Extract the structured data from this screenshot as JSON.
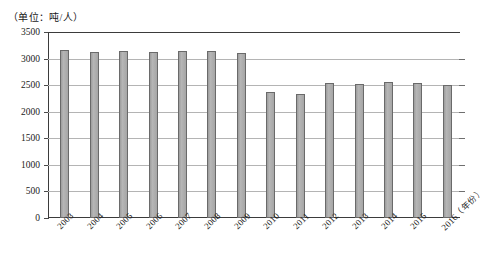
{
  "chart_data": {
    "type": "bar",
    "title": "",
    "subtitle": "",
    "unit_label": "（单位：吨/人）",
    "xlabel": "（年份）",
    "ylabel": "",
    "ylim": [
      0,
      3500
    ],
    "ytick_step": 500,
    "grid": true,
    "legend": "none",
    "bar_color": "#a8a8a8",
    "bar_border_color": "#6a6a6a",
    "grid_color": "#b4b4b4",
    "axis_color": "#3b3b3b",
    "categories": [
      "2003",
      "2004",
      "2005",
      "2006",
      "2007",
      "2008",
      "2009",
      "2010",
      "2011",
      "2012",
      "2013",
      "2014",
      "2015",
      "2016"
    ],
    "values": [
      3160,
      3120,
      3150,
      3130,
      3140,
      3140,
      3100,
      2380,
      2340,
      2540,
      2530,
      2560,
      2540,
      2510
    ],
    "yticks": [
      "0",
      "500",
      "1000",
      "1500",
      "2000",
      "2500",
      "3000",
      "3500"
    ],
    "xtick_labels": [
      "2003",
      "2004",
      "2005",
      "2006",
      "2007",
      "2008",
      "2009",
      "2010",
      "2011",
      "2012",
      "2013",
      "2014",
      "2015",
      "2016"
    ],
    "xaxis_suffix": "（年份）"
  }
}
